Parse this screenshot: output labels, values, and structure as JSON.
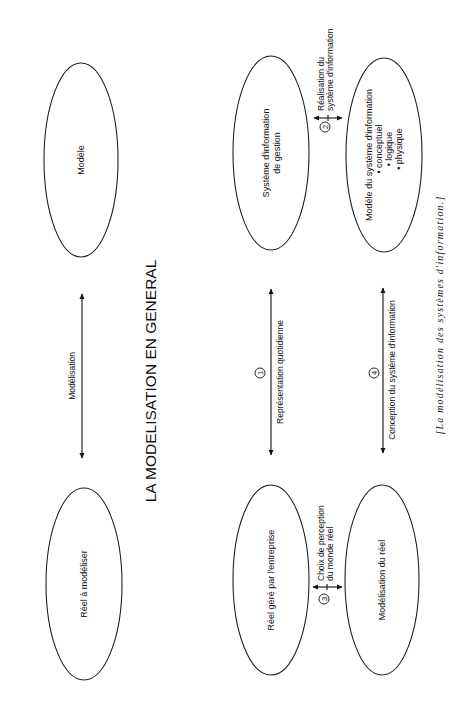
{
  "title": "LA MODELISATION EN GENERAL",
  "caption": "[La modélisation des systèmes d'information.]",
  "nodes": {
    "modele": {
      "lines": [
        "Modèle"
      ]
    },
    "reel_a_modeliser": {
      "lines": [
        "Réel à modéliser"
      ]
    },
    "systeme_information_gestion": {
      "lines": [
        "Système d'information",
        "de gestion"
      ]
    },
    "modele_systeme_information": {
      "lines": [
        "Modèle du système d'information",
        "• conceptuel",
        "• logique",
        "• physique"
      ]
    },
    "reel_gere": {
      "lines": [
        "Réel géré par l'entreprise"
      ]
    },
    "modelisation_du_reel": {
      "lines": [
        "Modélisation du réel"
      ]
    }
  },
  "arrows": {
    "modelisation": {
      "label": "Modélisation",
      "number": ""
    },
    "representation": {
      "label": "Représentation quotidienne",
      "number": "1"
    },
    "realisation": {
      "label_lines": [
        "Réalisation du",
        "système d'information"
      ],
      "number": "2"
    },
    "choix": {
      "label_lines": [
        "Choix de perception",
        "du monde réel"
      ],
      "number": "3"
    },
    "conception": {
      "label": "Conception du système d'information",
      "number": "4"
    }
  }
}
